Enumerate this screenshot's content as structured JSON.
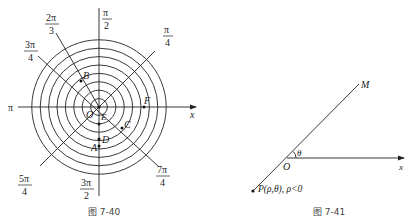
{
  "figure_left": {
    "caption": "图 7-40",
    "center": {
      "x": 99,
      "y": 107
    },
    "circle_count": 8,
    "circle_spacing": 8.4,
    "stroke_color": "#222222",
    "angle_labels": {
      "pi": "π",
      "pi_over_2": {
        "num": "π",
        "den": "2"
      },
      "two_pi_over_3": {
        "num": "2π",
        "den": "3"
      },
      "three_pi_over_4": {
        "num": "3π",
        "den": "4"
      },
      "pi_over_4": {
        "num": "π",
        "den": "4"
      },
      "five_pi_over_4": {
        "num": "5π",
        "den": "4"
      },
      "three_pi_over_2": {
        "num": "3π",
        "den": "2"
      },
      "seven_pi_over_4": {
        "num": "7π",
        "den": "4"
      }
    },
    "axis_label": "x",
    "points": {
      "O": "O",
      "A": "A",
      "B": "B",
      "C": "C",
      "D": "D",
      "E": "E",
      "F": "F"
    }
  },
  "figure_right": {
    "caption": "图 7-41",
    "origin_label": "O",
    "ray_label": "M",
    "angle_label": "θ",
    "axis_label": "x",
    "point_label": "P(ρ,θ), ρ<0"
  }
}
